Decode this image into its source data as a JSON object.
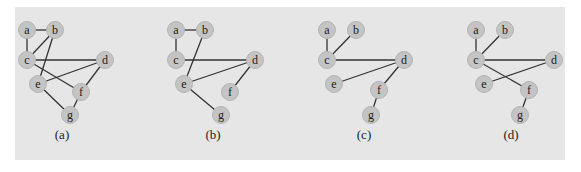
{
  "figure": {
    "background": "#e6e6e6",
    "node_fill": "#c4c4c4",
    "edge_color": "#333333",
    "graphs": [
      {
        "caption": "(a)",
        "caption_pos": [
          62,
          139
        ],
        "nodes": {
          "a": [
            27,
            30
          ],
          "b": [
            55,
            30
          ],
          "c": [
            27,
            60
          ],
          "d": [
            105,
            60
          ],
          "e": [
            38,
            84
          ],
          "f": [
            81,
            92
          ],
          "g": [
            70,
            115
          ]
        },
        "edges": [
          [
            "a",
            "b"
          ],
          [
            "a",
            "c"
          ],
          [
            "b",
            "c"
          ],
          [
            "b",
            "e"
          ],
          [
            "c",
            "d"
          ],
          [
            "c",
            "f"
          ],
          [
            "d",
            "e"
          ],
          [
            "d",
            "f"
          ],
          [
            "e",
            "g"
          ],
          [
            "f",
            "g"
          ]
        ]
      },
      {
        "caption": "(b)",
        "caption_pos": [
          213,
          139
        ],
        "nodes": {
          "a": [
            176,
            30
          ],
          "b": [
            205,
            30
          ],
          "c": [
            176,
            60
          ],
          "d": [
            255,
            60
          ],
          "e": [
            184,
            84
          ],
          "f": [
            230,
            92
          ],
          "g": [
            221,
            115
          ]
        },
        "edges": [
          [
            "a",
            "b"
          ],
          [
            "a",
            "c"
          ],
          [
            "b",
            "e"
          ],
          [
            "c",
            "d"
          ],
          [
            "d",
            "e"
          ],
          [
            "d",
            "f"
          ],
          [
            "e",
            "g"
          ]
        ]
      },
      {
        "caption": "(c)",
        "caption_pos": [
          364,
          139
        ],
        "nodes": {
          "a": [
            327,
            30
          ],
          "b": [
            356,
            30
          ],
          "c": [
            327,
            60
          ],
          "d": [
            404,
            60
          ],
          "e": [
            334,
            84
          ],
          "f": [
            379,
            90
          ],
          "g": [
            371,
            115
          ]
        },
        "edges": [
          [
            "a",
            "c"
          ],
          [
            "b",
            "c"
          ],
          [
            "c",
            "d"
          ],
          [
            "d",
            "e"
          ],
          [
            "d",
            "f"
          ],
          [
            "f",
            "g"
          ]
        ]
      },
      {
        "caption": "(d)",
        "caption_pos": [
          511,
          139
        ],
        "nodes": {
          "a": [
            476,
            30
          ],
          "b": [
            505,
            30
          ],
          "c": [
            476,
            60
          ],
          "d": [
            554,
            60
          ],
          "e": [
            484,
            84
          ],
          "f": [
            529,
            90
          ],
          "g": [
            520,
            115
          ]
        },
        "edges": [
          [
            "a",
            "c"
          ],
          [
            "b",
            "c"
          ],
          [
            "c",
            "d"
          ],
          [
            "c",
            "f"
          ],
          [
            "d",
            "e"
          ],
          [
            "f",
            "g"
          ]
        ]
      }
    ]
  }
}
